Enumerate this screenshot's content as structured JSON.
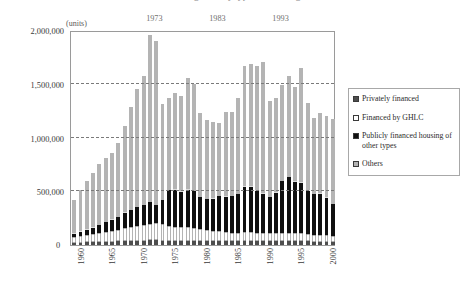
{
  "title": "Housing starts by type of financing",
  "units_label": "(units)",
  "zero_label": "0",
  "decade_markers": [
    {
      "label": "1973",
      "year": 1973
    },
    {
      "label": "1983",
      "year": 1983
    },
    {
      "label": "1993",
      "year": 1993
    }
  ],
  "legend": {
    "items": [
      {
        "key": "privately_financed",
        "label": "Privately financed",
        "color": "#4d4d4d",
        "swatch": "filled-dark-square-icon"
      },
      {
        "key": "ghlc",
        "label": "Financed by GHLC",
        "color": "#ffffff",
        "swatch": "empty-square-icon"
      },
      {
        "key": "public_other",
        "label": "Publicly financed housing of other types",
        "color": "#101010",
        "swatch": "filled-black-square-icon"
      },
      {
        "key": "others",
        "label": "Others",
        "color": "#b4b4b4",
        "swatch": "hatched-square-icon"
      }
    ]
  },
  "chart_data": {
    "type": "bar",
    "subtype": "stacked",
    "title": "Housing starts by type of financing",
    "xlabel": "",
    "ylabel": "(units)",
    "ylim": [
      0,
      2000000
    ],
    "ytick_labels": [
      "0",
      "500,000",
      "1,000,000",
      "1,500,000",
      "2,000,000"
    ],
    "yticks": [
      0,
      500000,
      1000000,
      1500000,
      2000000
    ],
    "grid": "horizontal-dashed",
    "legend_position": "right",
    "xtick_labels": [
      "1960",
      "1965",
      "1970",
      "1975",
      "1980",
      "1985",
      "1990",
      "1995",
      "2000"
    ],
    "xticks": [
      1960,
      1965,
      1970,
      1975,
      1980,
      1985,
      1990,
      1995,
      2000
    ],
    "x": [
      1960,
      1961,
      1962,
      1963,
      1964,
      1965,
      1966,
      1967,
      1968,
      1969,
      1970,
      1971,
      1972,
      1973,
      1974,
      1975,
      1976,
      1977,
      1978,
      1979,
      1980,
      1981,
      1982,
      1983,
      1984,
      1985,
      1986,
      1987,
      1988,
      1989,
      1990,
      1991,
      1992,
      1993,
      1994,
      1995,
      1996,
      1997,
      1998,
      1999,
      2000,
      2001
    ],
    "series": [
      {
        "name": "Others",
        "color": "#b4b4b4",
        "values": [
          20000,
          22000,
          24000,
          26000,
          28000,
          30000,
          32000,
          34000,
          36000,
          38000,
          40000,
          42000,
          44000,
          46000,
          42000,
          40000,
          40000,
          40000,
          40000,
          40000,
          38000,
          36000,
          36000,
          36000,
          36000,
          36000,
          36000,
          38000,
          38000,
          38000,
          38000,
          36000,
          36000,
          36000,
          36000,
          36000,
          36000,
          34000,
          32000,
          32000,
          32000,
          30000
        ]
      },
      {
        "name": "Publicly financed housing of other types",
        "color": "#101010",
        "values": [
          55000,
          60000,
          68000,
          75000,
          85000,
          95000,
          100000,
          110000,
          120000,
          130000,
          135000,
          140000,
          150000,
          160000,
          150000,
          140000,
          130000,
          125000,
          125000,
          120000,
          110000,
          100000,
          95000,
          90000,
          85000,
          80000,
          80000,
          80000,
          80000,
          78000,
          75000,
          72000,
          72000,
          75000,
          75000,
          78000,
          75000,
          68000,
          62000,
          60000,
          58000,
          55000
        ]
      },
      {
        "name": "Financed by GHLC",
        "color": "#ffffff",
        "values": [
          30000,
          38000,
          48000,
          60000,
          75000,
          90000,
          105000,
          120000,
          140000,
          160000,
          175000,
          190000,
          205000,
          170000,
          230000,
          330000,
          340000,
          330000,
          350000,
          340000,
          300000,
          290000,
          300000,
          330000,
          330000,
          340000,
          360000,
          420000,
          420000,
          390000,
          360000,
          340000,
          380000,
          480000,
          520000,
          470000,
          470000,
          400000,
          380000,
          380000,
          350000,
          300000
        ]
      },
      {
        "name": "Privately financed",
        "color": "#4d4d4d",
        "values": [
          315000,
          390000,
          460000,
          509000,
          562000,
          595000,
          623000,
          686000,
          814000,
          952000,
          1100000,
          1198000,
          1551000,
          1524000,
          888000,
          855000,
          900000,
          893000,
          1035000,
          1000000,
          780000,
          734000,
          715000,
          681000,
          783000,
          783000,
          894000,
          1130000,
          1146000,
          1156000,
          1234000,
          896000,
          882000,
          894000,
          938000,
          886000,
          1062000,
          823000,
          708000,
          759000,
          760000,
          790000
        ]
      }
    ],
    "totals": [
      420000,
      510000,
      600000,
      670000,
      750000,
      810000,
      860000,
      950000,
      1110000,
      1280000,
      1450000,
      1570000,
      1950000,
      1900000,
      1310000,
      1365000,
      1410000,
      1388000,
      1550000,
      1500000,
      1228000,
      1160000,
      1146000,
      1137000,
      1234000,
      1239000,
      1370000,
      1668000,
      1684000,
      1662000,
      1707000,
      1344000,
      1370000,
      1485000,
      1569000,
      1470000,
      1643000,
      1325000,
      1182000,
      1231000,
      1200000,
      1175000
    ]
  }
}
